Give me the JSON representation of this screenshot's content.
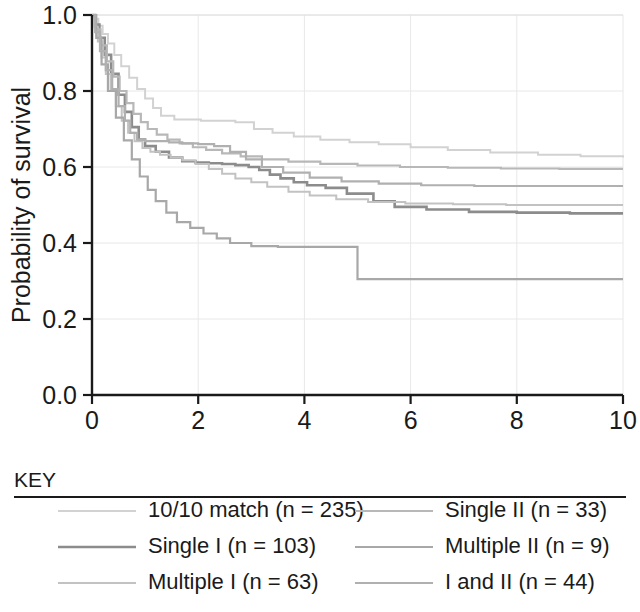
{
  "chart_data": {
    "type": "line",
    "title": "",
    "subtitle": "",
    "xlabel": "",
    "ylabel": "Probability of survival",
    "xlim": [
      0,
      10
    ],
    "ylim": [
      0.0,
      1.0
    ],
    "xticks": [
      0,
      2,
      4,
      6,
      8,
      10
    ],
    "xtick_labels": [
      "0",
      "2",
      "4",
      "6",
      "8",
      "10"
    ],
    "yticks": [
      0.0,
      0.2,
      0.4,
      0.6,
      0.8,
      1.0
    ],
    "ytick_labels": [
      "0.0",
      "0.2",
      "0.4",
      "0.6",
      "0.8",
      "1.0"
    ],
    "grid": true,
    "grid_color": "#e8e8e8",
    "legend_position": "below",
    "step_plot": true,
    "series": [
      {
        "name": "10/10 match (n = 235)",
        "key": "match10",
        "color": "#d2d2d2",
        "width": 2.0,
        "final_value": 0.625,
        "x": [
          0.0,
          0.05,
          0.12,
          0.2,
          0.3,
          0.42,
          0.55,
          0.7,
          0.85,
          1.0,
          1.15,
          1.3,
          1.55,
          1.8,
          2.05,
          2.35,
          2.7,
          3.05,
          3.4,
          3.8,
          4.3,
          4.85,
          5.4,
          6.0,
          6.7,
          7.5,
          8.4,
          9.2,
          10.0
        ],
        "y": [
          1.0,
          0.99,
          0.972,
          0.95,
          0.925,
          0.895,
          0.865,
          0.835,
          0.805,
          0.78,
          0.755,
          0.735,
          0.725,
          0.725,
          0.722,
          0.722,
          0.718,
          0.7,
          0.69,
          0.68,
          0.672,
          0.665,
          0.66,
          0.652,
          0.645,
          0.638,
          0.632,
          0.628,
          0.625
        ]
      },
      {
        "name": "Single I (n = 103)",
        "key": "single1",
        "color": "#8c8c8c",
        "width": 2.6,
        "final_value": 0.478,
        "x": [
          0.0,
          0.06,
          0.14,
          0.24,
          0.36,
          0.5,
          0.62,
          0.75,
          0.88,
          1.0,
          1.2,
          1.45,
          1.7,
          1.95,
          2.2,
          2.45,
          2.7,
          2.95,
          3.15,
          3.35,
          3.55,
          3.8,
          4.05,
          4.4,
          4.8,
          5.3,
          5.7,
          6.3,
          7.1,
          8.0,
          9.0,
          10.0
        ],
        "y": [
          1.0,
          0.975,
          0.94,
          0.895,
          0.845,
          0.79,
          0.745,
          0.705,
          0.672,
          0.655,
          0.64,
          0.625,
          0.615,
          0.612,
          0.61,
          0.608,
          0.605,
          0.6,
          0.592,
          0.58,
          0.57,
          0.56,
          0.552,
          0.545,
          0.53,
          0.51,
          0.495,
          0.488,
          0.482,
          0.48,
          0.478,
          0.478
        ]
      },
      {
        "name": "Multiple I (n = 63)",
        "key": "multiple1",
        "color": "#c2c2c2",
        "width": 2.0,
        "final_value": 0.5,
        "x": [
          0.0,
          0.05,
          0.11,
          0.18,
          0.26,
          0.35,
          0.45,
          0.56,
          0.68,
          0.8,
          0.95,
          1.1,
          1.28,
          1.48,
          1.7,
          1.95,
          2.2,
          2.45,
          2.7,
          3.0,
          3.3,
          3.7,
          4.1,
          4.6,
          5.2,
          5.9,
          6.8,
          7.8,
          8.9,
          10.0
        ],
        "y": [
          1.0,
          0.968,
          0.93,
          0.888,
          0.845,
          0.8,
          0.76,
          0.722,
          0.69,
          0.668,
          0.65,
          0.64,
          0.632,
          0.625,
          0.618,
          0.608,
          0.595,
          0.582,
          0.57,
          0.56,
          0.548,
          0.535,
          0.525,
          0.515,
          0.508,
          0.504,
          0.502,
          0.5,
          0.5,
          0.5
        ]
      },
      {
        "name": "Single II (n = 33)",
        "key": "single2",
        "color": "#b8b8b8",
        "width": 2.2,
        "final_value": 0.595,
        "x": [
          0.0,
          0.07,
          0.16,
          0.28,
          0.4,
          0.52,
          0.65,
          0.78,
          0.92,
          1.05,
          1.22,
          1.42,
          1.65,
          1.9,
          2.15,
          2.45,
          2.8,
          3.2,
          3.7,
          4.3,
          5.0,
          5.8,
          6.7,
          7.7,
          8.8,
          10.0
        ],
        "y": [
          1.0,
          0.962,
          0.92,
          0.878,
          0.838,
          0.8,
          0.768,
          0.74,
          0.718,
          0.7,
          0.685,
          0.672,
          0.662,
          0.652,
          0.645,
          0.636,
          0.628,
          0.62,
          0.614,
          0.608,
          0.604,
          0.6,
          0.598,
          0.596,
          0.595,
          0.595
        ]
      },
      {
        "name": "Multiple II (n = 9)",
        "key": "multiple2",
        "color": "#a8a8a8",
        "width": 2.2,
        "final_value": 0.305,
        "x": [
          0.0,
          0.08,
          0.18,
          0.3,
          0.45,
          0.6,
          0.75,
          0.9,
          1.05,
          1.2,
          1.4,
          1.6,
          1.85,
          2.1,
          2.35,
          2.6,
          3.0,
          3.5,
          4.2,
          4.9,
          5.0,
          6.0,
          7.2,
          8.5,
          10.0
        ],
        "y": [
          1.0,
          0.94,
          0.87,
          0.8,
          0.73,
          0.67,
          0.62,
          0.575,
          0.54,
          0.51,
          0.48,
          0.455,
          0.44,
          0.425,
          0.412,
          0.4,
          0.392,
          0.39,
          0.39,
          0.39,
          0.305,
          0.305,
          0.305,
          0.305,
          0.305
        ]
      },
      {
        "name": "I and II (n = 44)",
        "key": "iandii",
        "color": "#b0b0b0",
        "width": 2.2,
        "final_value": 0.55,
        "x": [
          0.0,
          0.06,
          0.15,
          0.26,
          0.38,
          0.5,
          0.62,
          0.72,
          0.85,
          1.0,
          1.2,
          1.45,
          1.7,
          2.0,
          2.3,
          2.6,
          2.9,
          3.2,
          3.6,
          4.1,
          4.7,
          5.4,
          6.2,
          7.2,
          8.4,
          10.0
        ],
        "y": [
          1.0,
          0.955,
          0.905,
          0.855,
          0.805,
          0.76,
          0.722,
          0.69,
          0.672,
          0.668,
          0.668,
          0.665,
          0.662,
          0.66,
          0.655,
          0.64,
          0.62,
          0.6,
          0.585,
          0.572,
          0.562,
          0.556,
          0.552,
          0.55,
          0.55,
          0.55
        ]
      }
    ]
  },
  "axes": {
    "ylabel": "Probability of survival",
    "xtick_labels": [
      "0",
      "2",
      "4",
      "6",
      "8",
      "10"
    ],
    "ytick_labels": [
      "0.0",
      "0.2",
      "0.4",
      "0.6",
      "0.8",
      "1.0"
    ]
  },
  "key": {
    "title": "KEY",
    "entries": [
      {
        "label": "10/10 match (n = 235)",
        "color": "#d2d2d2",
        "width": 2.0,
        "column": "left",
        "row": 0
      },
      {
        "label": "Single I (n = 103)",
        "color": "#8c8c8c",
        "width": 2.6,
        "column": "left",
        "row": 1
      },
      {
        "label": "Multiple I (n = 63)",
        "color": "#c2c2c2",
        "width": 2.0,
        "column": "left",
        "row": 2
      },
      {
        "label": "Single II (n = 33)",
        "color": "#b8b8b8",
        "width": 2.2,
        "column": "right",
        "row": 0
      },
      {
        "label": "Multiple II (n = 9)",
        "color": "#a8a8a8",
        "width": 2.2,
        "column": "right",
        "row": 1
      },
      {
        "label": "I and II (n = 44)",
        "color": "#b0b0b0",
        "width": 2.2,
        "column": "right",
        "row": 2
      }
    ]
  }
}
